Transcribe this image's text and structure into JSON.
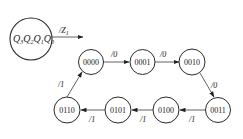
{
  "legend": {
    "circle_text_parts": [
      {
        "main": "Q",
        "sub": "3"
      },
      {
        "main": "Q",
        "sub": "2"
      },
      {
        "main": "Q",
        "sub": "1"
      },
      {
        "main": "Q",
        "sub": "0"
      }
    ],
    "output_label_main": "/Z",
    "output_label_sub": "1"
  },
  "states": [
    {
      "id": "s0",
      "label": "0000"
    },
    {
      "id": "s1",
      "label": "0001"
    },
    {
      "id": "s2",
      "label": "0010"
    },
    {
      "id": "s3",
      "label": "0011"
    },
    {
      "id": "s4",
      "label": "0100"
    },
    {
      "id": "s5",
      "label": "0101"
    },
    {
      "id": "s6",
      "label": "0110"
    }
  ],
  "transitions": [
    {
      "from": "0000",
      "to": "0001",
      "label": "/0"
    },
    {
      "from": "0001",
      "to": "0010",
      "label": "/0"
    },
    {
      "from": "0010",
      "to": "0011",
      "label": "/0"
    },
    {
      "from": "0011",
      "to": "0100",
      "label": "/1"
    },
    {
      "from": "0100",
      "to": "0101",
      "label": "/1"
    },
    {
      "from": "0101",
      "to": "0110",
      "label": "/1"
    },
    {
      "from": "0110",
      "to": "0000",
      "label": "/1"
    }
  ]
}
